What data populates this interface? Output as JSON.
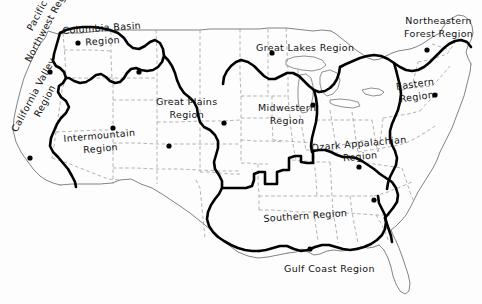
{
  "map": {
    "title": "United States Regions Map",
    "background_color": "#fdfdfd",
    "ink_color": "#111111",
    "thick_boundary_color": "#000000",
    "state_line_color": "#8a8a8a",
    "coastline_color": "#6f6f6f",
    "dot_color": "#000000",
    "width": 482,
    "height": 304
  },
  "regions": [
    {
      "id": "pacific-northwest",
      "label": "Pacific\nNorthwest Region",
      "line1": "Pacific",
      "line2": "Northwest Region",
      "x": 10,
      "y": 52,
      "rotation": -62,
      "dot": {
        "x": 50,
        "y": 72
      }
    },
    {
      "id": "columbia-basin",
      "label": "Columbia Basin\nRegion",
      "line1": "Columbia Basin",
      "line2": "Region",
      "x": 62,
      "y": 24,
      "rotation": -4,
      "dot": {
        "x": 78,
        "y": 43
      }
    },
    {
      "id": "california-valley",
      "label": "California Valley\nRegion",
      "line1": "California Valley",
      "line2": "Region",
      "x": 8,
      "y": 128,
      "rotation": -62,
      "dot": {
        "x": 30,
        "y": 158
      }
    },
    {
      "id": "intermountain",
      "label": "Intermountain\nRegion",
      "line1": "Intermountain",
      "line2": "Region",
      "x": 63,
      "y": 132,
      "rotation": -5,
      "dot": {
        "x": 113,
        "y": 128
      }
    },
    {
      "id": "great-plains",
      "label": "Great Plains\nRegion",
      "line1": "Great Plains",
      "line2": "Region",
      "x": 156,
      "y": 95,
      "rotation": 0,
      "dot": {
        "x": 169,
        "y": 146
      }
    },
    {
      "id": "great-lakes",
      "label": "Great Lakes Region",
      "line1": "Great Lakes Region",
      "line2": "",
      "x": 256,
      "y": 42,
      "rotation": 0,
      "dot": {
        "x": 272,
        "y": 53
      }
    },
    {
      "id": "midwestern",
      "label": "Midwestern\nRegion",
      "line1": "Midwestern",
      "line2": "Region",
      "x": 258,
      "y": 101,
      "rotation": 0,
      "dot": {
        "x": 313,
        "y": 105
      }
    },
    {
      "id": "northeastern-forest",
      "label": "Northeastern\nForest Region",
      "line1": "Northeastern",
      "line2": "Forest Region",
      "x": 404,
      "y": 14,
      "rotation": 0,
      "dot": {
        "x": 427,
        "y": 50
      }
    },
    {
      "id": "eastern",
      "label": "Eastern\nRegion",
      "line1": "Eastern",
      "line2": "Region",
      "x": 395,
      "y": 80,
      "rotation": -8,
      "dot": {
        "x": 435,
        "y": 95
      }
    },
    {
      "id": "ozark-appalachian",
      "label": "Ozark Appalachian\nRegion",
      "line1": "Ozark Appalachian",
      "line2": "Region",
      "x": 311,
      "y": 141,
      "rotation": -5,
      "dot": {
        "x": 359,
        "y": 167
      }
    },
    {
      "id": "southern",
      "label": "Southern Region",
      "line1": "Southern Region",
      "line2": "",
      "x": 263,
      "y": 213,
      "rotation": -4,
      "dot": {
        "x": 374,
        "y": 200
      }
    },
    {
      "id": "gulf-coast",
      "label": "Gulf Coast Region",
      "line1": "Gulf Coast Region",
      "line2": "",
      "x": 284,
      "y": 263,
      "rotation": 0,
      "dot": {
        "x": 310,
        "y": 249
      }
    }
  ],
  "extra_dots": [
    {
      "id": "dot-idaho",
      "x": 139,
      "y": 72
    },
    {
      "id": "dot-colorado",
      "x": 224,
      "y": 123
    }
  ]
}
